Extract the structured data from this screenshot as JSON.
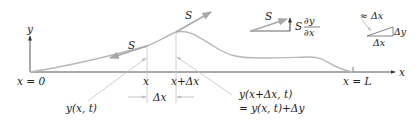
{
  "diagram": {
    "axes": {
      "y_label": "y",
      "x_label": "x",
      "origin_label": "x = 0",
      "end_label": "x = L"
    },
    "segment": {
      "left_label": "x",
      "right_label": "x+Δx",
      "width_label": "Δx"
    },
    "tension": {
      "left_label": "S",
      "right_label": "S"
    },
    "displacement": {
      "left_label": "y(x, t)",
      "right_label_line1": "y(x+Δx, t)",
      "right_label_line2": "= y(x, t)+Δy"
    },
    "force_decomposition": {
      "tension_label": "S",
      "vertical_component_prefix": "S",
      "partial_numerator": "∂y",
      "partial_denominator": "∂x"
    },
    "small_triangle": {
      "hypotenuse_label": "≈ Δx",
      "vertical_label": "Δy",
      "horizontal_label": "Δx"
    },
    "colors": {
      "curve": "#b8b8b8",
      "arrow": "#a8a8a8",
      "axis": "#555555",
      "text": "#222222"
    }
  }
}
